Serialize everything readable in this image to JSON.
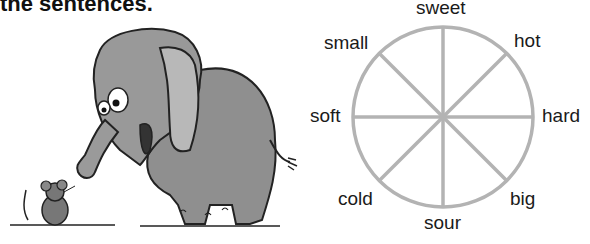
{
  "heading": "the sentences.",
  "illustration": {
    "description": "cartoon elephant looking down at a small mouse",
    "elephant_color": "#8f8f8f",
    "mouse_color": "#777777"
  },
  "wheel": {
    "line_color": "#b3b3b3",
    "labels": {
      "top": "sweet",
      "top_right": "hot",
      "right": "hard",
      "bottom_right": "big",
      "bottom": "sour",
      "bottom_left": "cold",
      "left": "soft",
      "top_left": "small"
    }
  }
}
